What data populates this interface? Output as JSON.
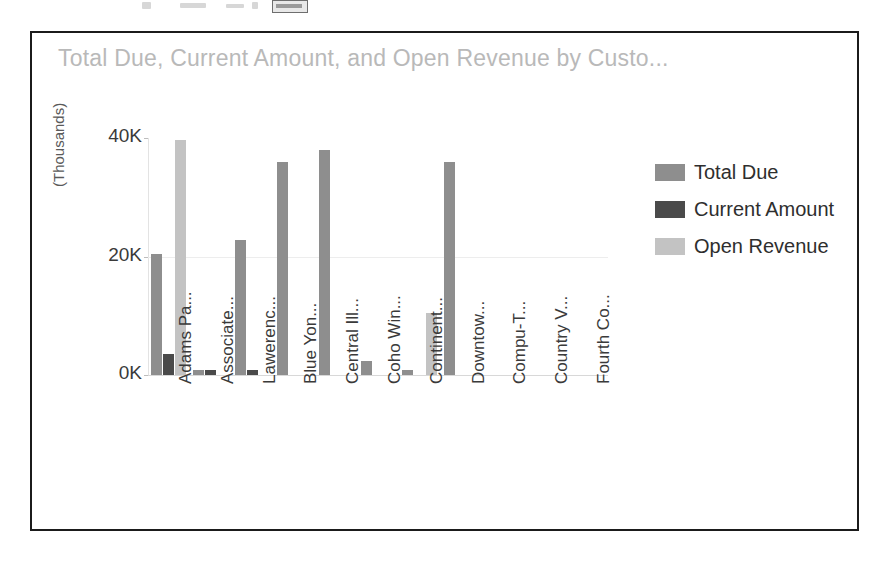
{
  "window": {
    "artifact_note": ""
  },
  "chart": {
    "title": "Total Due, Current Amount, and Open Revenue by Custo...",
    "yaxis_title": "(Thousands)"
  },
  "legend": {
    "items": [
      {
        "label": "Total Due",
        "color": "#8e8e8e"
      },
      {
        "label": "Current Amount",
        "color": "#4a4a4a"
      },
      {
        "label": "Open Revenue",
        "color": "#c3c3c3"
      }
    ]
  },
  "chart_data": {
    "type": "bar",
    "title": "Total Due, Current Amount, and Open Revenue by Custo...",
    "xlabel": "",
    "ylabel": "(Thousands)",
    "ylim": [
      0,
      40
    ],
    "yticks": [
      "0K",
      "20K",
      "40K"
    ],
    "ytick_values": [
      0,
      20,
      40
    ],
    "grid": true,
    "legend_position": "right",
    "units": "Thousands",
    "categories": [
      "Adams Pa...",
      "Associate...",
      "Lawerenc...",
      "Blue Yon...",
      "Central Ill...",
      "Coho Win...",
      "Continent...",
      "Downtow...",
      "Compu-T...",
      "Country V...",
      "Fourth Co..."
    ],
    "series": [
      {
        "name": "Total Due",
        "color": "#8e8e8e",
        "values": [
          20.5,
          0.9,
          22.8,
          36.0,
          38.0,
          2.3,
          0.9,
          36.0,
          0,
          0,
          0
        ]
      },
      {
        "name": "Current Amount",
        "color": "#4a4a4a",
        "values": [
          3.6,
          0.8,
          0.9,
          0,
          0,
          0,
          0,
          0,
          0,
          0,
          0
        ]
      },
      {
        "name": "Open Revenue",
        "color": "#c3c3c3",
        "values": [
          39.6,
          0,
          0,
          0,
          0,
          0,
          10.5,
          0,
          0,
          0,
          0
        ]
      }
    ]
  }
}
